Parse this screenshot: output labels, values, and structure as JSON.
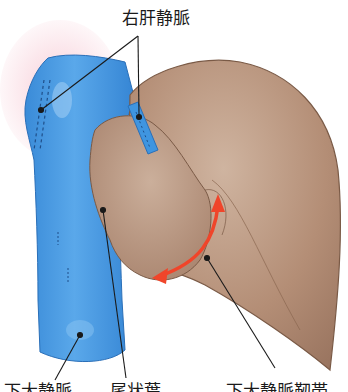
{
  "diagram": {
    "colors": {
      "vena_cava": "#3f95e0",
      "vena_cava_highlight": "#8ac4f2",
      "liver": "#b08a72",
      "liver_light": "#cdb09c",
      "liver_edge": "#7a5a46",
      "arrow": "#f0452a",
      "glow": "#f7c9d4",
      "leader": "#1a1a1a"
    },
    "labels": {
      "top": "右肝静脈",
      "bottom": [
        "下大静脈",
        "尾状葉",
        "下大静脈靭帯"
      ]
    }
  }
}
